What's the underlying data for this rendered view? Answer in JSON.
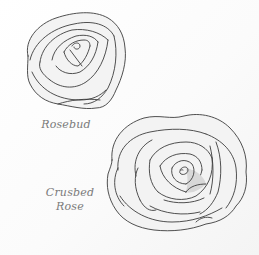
{
  "illustrations": [
    {
      "id": "rosebud",
      "caption": "Rosebud"
    },
    {
      "id": "crushed-rose",
      "caption_line1": "Crusbed",
      "caption_line2": "Rose"
    }
  ],
  "colors": {
    "line": "#3c3c3c",
    "caption": "#7a7a7a",
    "background": "#ffffff",
    "center_shade": "#d8d8d8"
  }
}
